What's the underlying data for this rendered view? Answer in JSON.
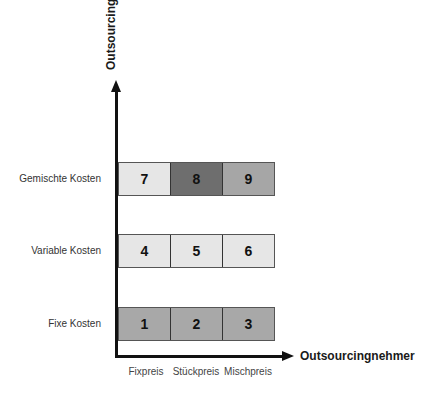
{
  "diagram": {
    "y_axis_title": "Outsourcinggeber",
    "x_axis_title": "Outsourcingnehmer",
    "rows": [
      {
        "label": "Gemischte Kosten",
        "cells": [
          {
            "number": "7",
            "color": "#e6e6e6"
          },
          {
            "number": "8",
            "color": "#6e6e6e"
          },
          {
            "number": "9",
            "color": "#a6a6a6"
          }
        ]
      },
      {
        "label": "Variable Kosten",
        "cells": [
          {
            "number": "4",
            "color": "#e6e6e6"
          },
          {
            "number": "5",
            "color": "#e6e6e6"
          },
          {
            "number": "6",
            "color": "#e6e6e6"
          }
        ]
      },
      {
        "label": "Fixe Kosten",
        "cells": [
          {
            "number": "1",
            "color": "#a8a8a8"
          },
          {
            "number": "2",
            "color": "#a8a8a8"
          },
          {
            "number": "3",
            "color": "#a8a8a8"
          }
        ]
      }
    ],
    "columns": [
      "Fixpreis",
      "Stückpreis",
      "Mischpreis"
    ]
  }
}
